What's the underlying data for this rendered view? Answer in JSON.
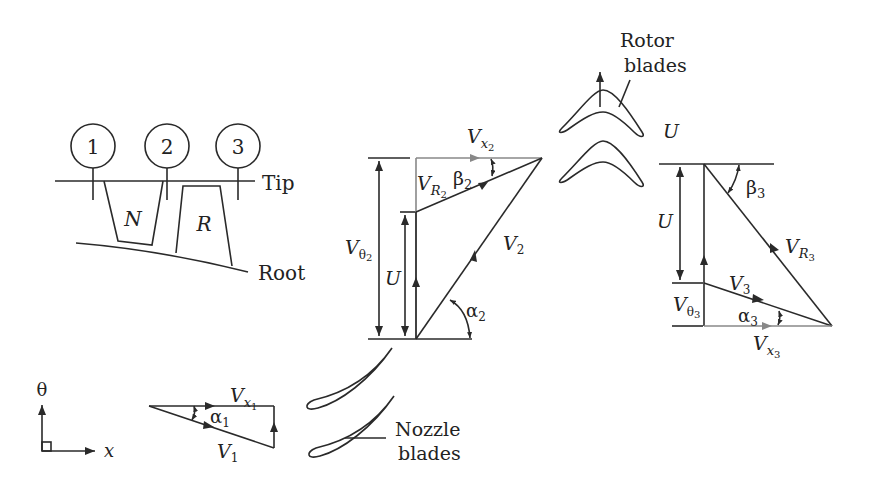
{
  "stations": {
    "labels": [
      "1",
      "2",
      "3"
    ],
    "tip_label": "Tip",
    "root_label": "Root",
    "nozzle_label": "N",
    "rotor_label": "R"
  },
  "axes": {
    "theta_label": "θ",
    "x_label": "x"
  },
  "inlet_triangle": {
    "vx": "V",
    "vx_sub": "x",
    "vx_subsub": "1",
    "v": "V",
    "v_sub": "1",
    "alpha": "α",
    "alpha_sub": "1"
  },
  "stage2_triangle": {
    "vx": "V",
    "vx_sub": "x",
    "vx_subsub": "2",
    "vr": "V",
    "vr_sub": "R",
    "vr_subsub": "2",
    "beta": "β",
    "beta_sub": "2",
    "vtheta": "V",
    "vtheta_sub": "θ",
    "vtheta_subsub": "2",
    "u": "U",
    "v": "V",
    "v_sub": "2",
    "alpha": "α",
    "alpha_sub": "2"
  },
  "stage3_triangle": {
    "u_top": "U",
    "u": "U",
    "beta": "β",
    "beta_sub": "3",
    "vr": "V",
    "vr_sub": "R",
    "vr_subsub": "3",
    "v": "V",
    "v_sub": "3",
    "vtheta": "V",
    "vtheta_sub": "θ",
    "vtheta_subsub": "3",
    "alpha": "α",
    "alpha_sub": "3",
    "vx": "V",
    "vx_sub": "x",
    "vx_subsub": "3"
  },
  "blades": {
    "rotor_line1": "Rotor",
    "rotor_line2": "blades",
    "nozzle_line1": "Nozzle",
    "nozzle_line2": "blades"
  },
  "colors": {
    "line": "#2a2a2a",
    "gray_arrow": "#888888",
    "background": "#ffffff"
  }
}
